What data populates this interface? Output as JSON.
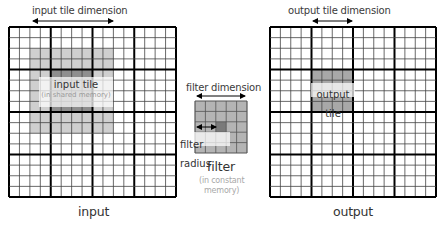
{
  "colors": {
    "grid_line": "#000000",
    "fine_line": "#444444",
    "halo": "#cfcfcf",
    "inner_tile": "#8e8e8e",
    "output_tile": "#a8a8a8",
    "filter_cell": "#b4b4b4",
    "filter_center": "#7a7a7a"
  },
  "input": {
    "dimension_label": "input tile dimension",
    "tile_label": "input tile",
    "tile_sublabel": "(in shared memory)",
    "caption": "input",
    "grid": {
      "cols": 16,
      "rows": 16,
      "block": 4
    },
    "halo": {
      "col_start": 2,
      "col_end": 10,
      "row_start": 2,
      "row_end": 10
    },
    "inner": {
      "col_start": 4,
      "col_end": 8,
      "row_start": 4,
      "row_end": 8
    }
  },
  "filter": {
    "dimension_label": "filter dimension",
    "radius_label": "filter radius",
    "caption": "filter",
    "sublabel_line1": "(in constant",
    "sublabel_line2": "memory)",
    "grid": {
      "cols": 5,
      "rows": 5
    },
    "center": {
      "col": 2,
      "row": 2
    }
  },
  "output": {
    "dimension_label": "output tile dimension",
    "tile_label": "output tile",
    "caption": "output",
    "grid": {
      "cols": 16,
      "rows": 16,
      "block": 4
    },
    "tile": {
      "col_start": 4,
      "col_end": 8,
      "row_start": 4,
      "row_end": 8
    }
  }
}
